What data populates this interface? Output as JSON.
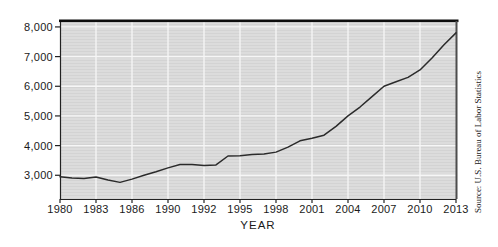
{
  "chart_data": {
    "type": "line",
    "xlabel": "YEAR",
    "ylabel": "",
    "source": "Source: U.S. Bureau of Labor Statistics",
    "x": [
      1980,
      1981,
      1982,
      1983,
      1984,
      1985,
      1986,
      1987,
      1988,
      1989,
      1990,
      1991,
      1992,
      1993,
      1994,
      1995,
      1996,
      1997,
      1998,
      1999,
      2000,
      2001,
      2002,
      2003,
      2004,
      2005,
      2006,
      2007,
      2008,
      2009,
      2010,
      2011,
      2012,
      2013
    ],
    "values": [
      2950,
      2910,
      2890,
      2940,
      2840,
      2760,
      2870,
      3000,
      3120,
      3250,
      3360,
      3360,
      3330,
      3350,
      3650,
      3660,
      3700,
      3720,
      3780,
      3950,
      4160,
      4250,
      4350,
      4650,
      5000,
      5300,
      5650,
      6000,
      6150,
      6300,
      6550,
      6950,
      7400,
      7800
    ],
    "x_tick_labels": [
      "1980",
      "1983",
      "1986",
      "1990",
      "1992",
      "1995",
      "1998",
      "2001",
      "2004",
      "2007",
      "2010",
      "2013"
    ],
    "y_tick_labels": [
      "8,000",
      "7,000",
      "6,000",
      "5,000",
      "4,000",
      "3,000"
    ],
    "y_ticks": [
      8000,
      7000,
      6000,
      5000,
      4000,
      3000
    ],
    "xlim": [
      1980,
      2013
    ],
    "ylim": [
      2200,
      8200
    ],
    "grid": true,
    "legend": "none",
    "colors": {
      "line": "#2b2b2b",
      "plot_bg": "#d8d8d8",
      "grid": "#f6f6f6",
      "axis": "#222222",
      "border_top": "#0d0d0d",
      "border_right": "#4d4d4d"
    }
  }
}
